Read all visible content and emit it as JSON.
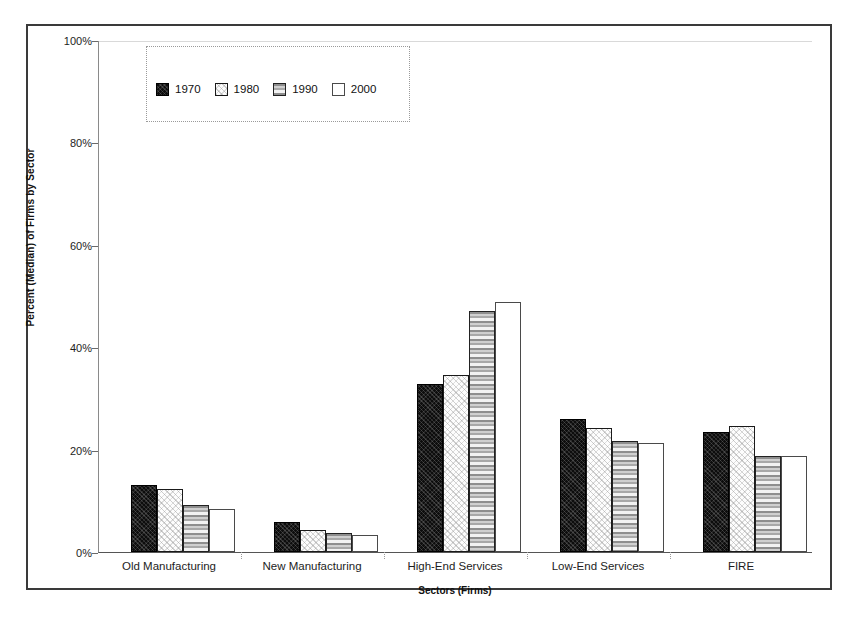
{
  "chart_data": {
    "type": "bar",
    "title": "",
    "subtitle": "",
    "xlabel": "Sectors (Firms)",
    "ylabel": "Percent (Median) of Firms by Sector",
    "categories": [
      "Old Manufacturing",
      "New Manufacturing",
      "High-End Services",
      "Low-End Services",
      "FIRE"
    ],
    "series": [
      {
        "name": "1970",
        "values": [
          13.1,
          5.9,
          32.8,
          26.0,
          23.4
        ],
        "pattern": "solid-black"
      },
      {
        "name": "1980",
        "values": [
          12.4,
          4.3,
          34.6,
          24.2,
          24.6
        ],
        "pattern": "light-speckle"
      },
      {
        "name": "1990",
        "values": [
          9.2,
          3.7,
          47.1,
          21.7,
          18.8
        ],
        "pattern": "horizontal-stripes"
      },
      {
        "name": "2000",
        "values": [
          8.4,
          3.3,
          48.8,
          21.3,
          18.8
        ],
        "pattern": "white-outline"
      }
    ],
    "ylim": [
      0,
      100
    ],
    "yticks": [
      0,
      20,
      40,
      60,
      80,
      100
    ],
    "ytick_labels": [
      "0%",
      "20%",
      "40%",
      "60%",
      "80%",
      "100%"
    ],
    "grid": true,
    "grid_axis": "y",
    "legend_position": "top-left-inside",
    "legend_entries": [
      "1970",
      "1980",
      "1990",
      "2000"
    ],
    "colors": {
      "series_1970": "#0d0d0d",
      "series_1980": "#fdfdfd",
      "series_1990": "#b5b5b5",
      "series_2000": "#ffffff",
      "axis": "#555555",
      "grid": "#b9b9b9",
      "frame": "#3a3a3a"
    }
  }
}
